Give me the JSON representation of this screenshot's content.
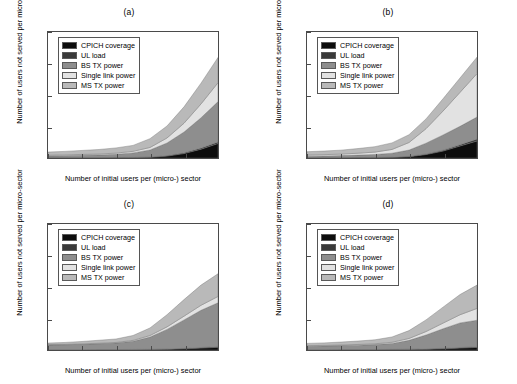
{
  "figure": {
    "panels": [
      "a",
      "b",
      "c",
      "d"
    ],
    "axis": {
      "xlabel": "Number of initial users per (micro-) sector",
      "ylabel": "Number of users not served per micro-sector",
      "xticks": [
        "40",
        "60",
        "80",
        "100",
        "120",
        "140"
      ],
      "yticks": [
        "0",
        "5",
        "10",
        "15",
        "20"
      ]
    },
    "legend": [
      {
        "label": "CPICH coverage",
        "color": "#0d0d0d"
      },
      {
        "label": "UL load",
        "color": "#3a3a3a"
      },
      {
        "label": "BS TX power",
        "color": "#8e8e8e"
      },
      {
        "label": "Single link power",
        "color": "#e2e2e2"
      },
      {
        "label": "MS TX power",
        "color": "#b9b9b9"
      }
    ]
  },
  "chart_data": [
    {
      "type": "area",
      "title": "(a)",
      "xlabel": "Number of initial users per (micro-) sector",
      "ylabel": "Number of users not served per micro-sector",
      "xlim": [
        40,
        140
      ],
      "ylim": [
        0,
        20
      ],
      "grid": false,
      "legend_position": "upper-left",
      "stacked": true,
      "x": [
        40,
        50,
        60,
        70,
        80,
        90,
        100,
        110,
        120,
        130,
        140
      ],
      "series": [
        {
          "name": "CPICH coverage",
          "color": "#0d0d0d",
          "values": [
            0.05,
            0.05,
            0.06,
            0.06,
            0.07,
            0.08,
            0.12,
            0.3,
            0.7,
            1.4,
            2.3
          ]
        },
        {
          "name": "UL load",
          "color": "#3a3a3a",
          "values": [
            0.02,
            0.02,
            0.02,
            0.02,
            0.03,
            0.03,
            0.05,
            0.08,
            0.12,
            0.18,
            0.25
          ]
        },
        {
          "name": "BS TX power",
          "color": "#8e8e8e",
          "values": [
            0.25,
            0.3,
            0.35,
            0.4,
            0.5,
            0.7,
            1.1,
            2.0,
            3.3,
            4.8,
            6.4
          ]
        },
        {
          "name": "Single link power",
          "color": "#e2e2e2",
          "values": [
            0.12,
            0.13,
            0.14,
            0.15,
            0.18,
            0.25,
            0.4,
            0.8,
            1.4,
            2.2,
            3.0
          ]
        },
        {
          "name": "MS TX power",
          "color": "#b9b9b9",
          "values": [
            0.5,
            0.55,
            0.63,
            0.72,
            0.82,
            0.94,
            1.4,
            1.9,
            2.6,
            3.3,
            4.0
          ]
        }
      ],
      "totals_at_140": 15.95
    },
    {
      "type": "area",
      "title": "(b)",
      "xlabel": "Number of initial users per (micro-) sector",
      "ylabel": "Number of users not served per micro-sector",
      "xlim": [
        40,
        140
      ],
      "ylim": [
        0,
        20
      ],
      "grid": false,
      "legend_position": "upper-left",
      "stacked": true,
      "x": [
        40,
        50,
        60,
        70,
        80,
        90,
        100,
        110,
        120,
        130,
        140
      ],
      "series": [
        {
          "name": "CPICH coverage",
          "color": "#0d0d0d",
          "values": [
            0.05,
            0.05,
            0.06,
            0.07,
            0.08,
            0.1,
            0.2,
            0.55,
            1.1,
            1.9,
            2.7
          ]
        },
        {
          "name": "UL load",
          "color": "#3a3a3a",
          "values": [
            0.02,
            0.02,
            0.02,
            0.03,
            0.03,
            0.04,
            0.06,
            0.1,
            0.15,
            0.22,
            0.3
          ]
        },
        {
          "name": "BS TX power",
          "color": "#8e8e8e",
          "values": [
            0.22,
            0.26,
            0.3,
            0.36,
            0.45,
            0.62,
            1.0,
            1.7,
            2.4,
            2.9,
            3.5
          ]
        },
        {
          "name": "Single link power",
          "color": "#e2e2e2",
          "values": [
            0.18,
            0.2,
            0.24,
            0.3,
            0.38,
            0.6,
            1.2,
            2.3,
            3.8,
            5.4,
            6.9
          ]
        },
        {
          "name": "MS TX power",
          "color": "#b9b9b9",
          "values": [
            0.53,
            0.57,
            0.63,
            0.74,
            0.86,
            1.04,
            1.24,
            1.55,
            1.95,
            2.28,
            2.6
          ]
        }
      ],
      "totals_at_140": 16.0
    },
    {
      "type": "area",
      "title": "(c)",
      "xlabel": "Number of initial users per (micro-) sector",
      "ylabel": "Number of users not served per micro-sector",
      "xlim": [
        40,
        140
      ],
      "ylim": [
        0,
        20
      ],
      "grid": false,
      "legend_position": "upper-left",
      "stacked": true,
      "x": [
        40,
        50,
        60,
        70,
        80,
        90,
        100,
        110,
        120,
        130,
        140
      ],
      "series": [
        {
          "name": "CPICH coverage",
          "color": "#0d0d0d",
          "values": [
            0.04,
            0.04,
            0.04,
            0.05,
            0.05,
            0.06,
            0.08,
            0.12,
            0.2,
            0.3,
            0.42
          ]
        },
        {
          "name": "UL load",
          "color": "#3a3a3a",
          "values": [
            0.02,
            0.02,
            0.02,
            0.02,
            0.02,
            0.03,
            0.03,
            0.05,
            0.07,
            0.1,
            0.13
          ]
        },
        {
          "name": "BS TX power",
          "color": "#8e8e8e",
          "values": [
            0.74,
            0.78,
            0.84,
            0.93,
            1.03,
            1.3,
            1.95,
            3.1,
            4.5,
            5.9,
            6.95
          ]
        },
        {
          "name": "Single link power",
          "color": "#e2e2e2",
          "values": [
            0.06,
            0.06,
            0.07,
            0.08,
            0.1,
            0.14,
            0.24,
            0.4,
            0.6,
            0.8,
            1.0
          ]
        },
        {
          "name": "MS TX power",
          "color": "#b9b9b9",
          "values": [
            0.24,
            0.3,
            0.38,
            0.47,
            0.55,
            0.77,
            1.2,
            1.93,
            2.63,
            3.2,
            3.6
          ]
        }
      ],
      "totals_at_140": 12.1
    },
    {
      "type": "area",
      "title": "(d)",
      "xlabel": "Number of initial users per (micro-) sector",
      "ylabel": "Number of users not served per micro-sector",
      "xlim": [
        40,
        140
      ],
      "ylim": [
        0,
        20
      ],
      "grid": false,
      "legend_position": "upper-left",
      "stacked": true,
      "x": [
        40,
        50,
        60,
        70,
        80,
        90,
        100,
        110,
        120,
        130,
        140
      ],
      "series": [
        {
          "name": "CPICH coverage",
          "color": "#0d0d0d",
          "values": [
            0.04,
            0.04,
            0.05,
            0.05,
            0.06,
            0.07,
            0.09,
            0.13,
            0.2,
            0.3,
            0.4
          ]
        },
        {
          "name": "UL load",
          "color": "#3a3a3a",
          "values": [
            0.02,
            0.02,
            0.02,
            0.02,
            0.02,
            0.03,
            0.04,
            0.05,
            0.07,
            0.1,
            0.12
          ]
        },
        {
          "name": "BS TX power",
          "color": "#8e8e8e",
          "values": [
            0.55,
            0.58,
            0.63,
            0.7,
            0.78,
            0.95,
            1.4,
            2.2,
            3.1,
            3.9,
            4.2
          ]
        },
        {
          "name": "Single link power",
          "color": "#e2e2e2",
          "values": [
            0.08,
            0.09,
            0.1,
            0.11,
            0.13,
            0.18,
            0.3,
            0.55,
            0.9,
            1.3,
            1.88
          ]
        },
        {
          "name": "MS TX power",
          "color": "#b9b9b9",
          "values": [
            0.36,
            0.4,
            0.46,
            0.54,
            0.63,
            0.84,
            1.25,
            1.85,
            2.53,
            3.2,
            3.7
          ]
        }
      ],
      "totals_at_140": 10.3
    }
  ]
}
